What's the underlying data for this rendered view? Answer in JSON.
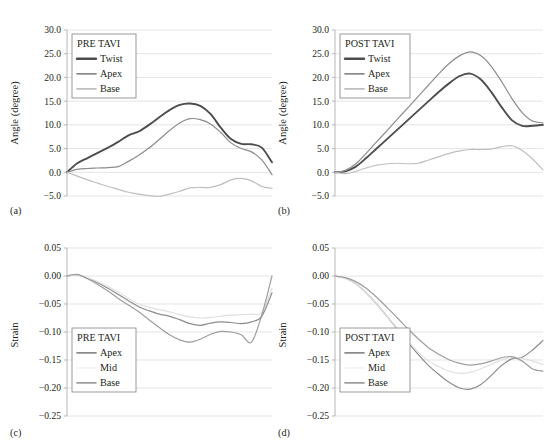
{
  "figure": {
    "panels": [
      {
        "key": "a",
        "caption": "(a)",
        "legend_title": "PRE TAVI",
        "ylabel": "Angle (degree)"
      },
      {
        "key": "b",
        "caption": "(b)",
        "legend_title": "POST TAVI",
        "ylabel": "Angle (degree)"
      },
      {
        "key": "c",
        "caption": "(c)",
        "legend_title": "PRE TAVI",
        "ylabel": "Strain"
      },
      {
        "key": "d",
        "caption": "(d)",
        "legend_title": "POST TAVI",
        "ylabel": "Strain"
      }
    ]
  },
  "colors": {
    "twist": "#4d4d4d",
    "apex": "#8c8c8c",
    "base": "#bfbfbf",
    "mid": "#e0e0e0",
    "grid": "#d9d9d9",
    "axis": "#a6a6a6",
    "text": "#231f20"
  },
  "chart_data": [
    {
      "id": "panel-a",
      "type": "line",
      "title": "PRE TAVI",
      "xlabel": "",
      "ylabel": "Angle (degree)",
      "ylim": [
        -5.0,
        30.0
      ],
      "ytick_labels": [
        "30.0",
        "25.0",
        "20.0",
        "15.0",
        "10.0",
        "5.0",
        "0.0",
        "-5.0"
      ],
      "yticks": [
        30.0,
        25.0,
        20.0,
        15.0,
        10.0,
        5.0,
        0.0,
        -5.0
      ],
      "xlim": [
        0,
        100
      ],
      "grid": true,
      "legend_position": "top-left",
      "x": [
        0,
        5,
        10,
        15,
        20,
        25,
        30,
        35,
        40,
        45,
        50,
        55,
        60,
        65,
        70,
        75,
        80,
        85,
        90,
        95,
        100
      ],
      "series": [
        {
          "name": "Twist",
          "color": "#4d4d4d",
          "width": 1.9,
          "values": [
            0.0,
            1.9,
            3.0,
            4.1,
            5.2,
            6.4,
            7.8,
            8.6,
            10.0,
            11.6,
            13.1,
            14.2,
            14.5,
            14.0,
            12.3,
            9.4,
            7.0,
            6.0,
            5.9,
            5.2,
            2.1
          ]
        },
        {
          "name": "Apex",
          "color": "#8c8c8c",
          "width": 1.2,
          "values": [
            0.0,
            0.6,
            0.8,
            0.9,
            1.0,
            1.2,
            2.3,
            3.6,
            5.1,
            6.9,
            8.8,
            10.4,
            11.3,
            11.1,
            10.2,
            8.4,
            6.2,
            5.0,
            4.3,
            2.6,
            -0.5
          ]
        },
        {
          "name": "Base",
          "color": "#bfbfbf",
          "width": 1.2,
          "values": [
            0.0,
            -0.8,
            -1.6,
            -2.3,
            -3.0,
            -3.6,
            -4.2,
            -4.6,
            -4.9,
            -5.1,
            -4.6,
            -4.0,
            -3.3,
            -3.2,
            -3.2,
            -2.6,
            -1.6,
            -1.3,
            -1.8,
            -3.0,
            -3.4
          ]
        }
      ]
    },
    {
      "id": "panel-b",
      "type": "line",
      "title": "POST TAVI",
      "xlabel": "",
      "ylabel": "Angle (degree)",
      "ylim": [
        -5.0,
        30.0
      ],
      "ytick_labels": [
        "30.0",
        "25.0",
        "20.0",
        "15.0",
        "10.0",
        "5.0",
        "0.0",
        "-5.0"
      ],
      "yticks": [
        30.0,
        25.0,
        20.0,
        15.0,
        10.0,
        5.0,
        0.0,
        -5.0
      ],
      "xlim": [
        0,
        100
      ],
      "grid": true,
      "legend_position": "top-left",
      "x": [
        0,
        5,
        10,
        15,
        20,
        25,
        30,
        35,
        40,
        45,
        50,
        55,
        60,
        65,
        70,
        75,
        80,
        85,
        90,
        95,
        100
      ],
      "series": [
        {
          "name": "Twist",
          "color": "#4d4d4d",
          "width": 1.9,
          "values": [
            0.0,
            0.2,
            1.2,
            3.0,
            5.0,
            7.0,
            9.0,
            11.0,
            13.0,
            15.0,
            17.0,
            18.8,
            20.3,
            20.8,
            19.6,
            17.0,
            13.8,
            11.0,
            9.8,
            9.8,
            10.0
          ]
        },
        {
          "name": "Apex",
          "color": "#8c8c8c",
          "width": 1.2,
          "values": [
            0.0,
            0.4,
            1.8,
            4.0,
            6.4,
            8.8,
            11.2,
            13.6,
            16.0,
            18.4,
            20.8,
            23.0,
            24.6,
            25.4,
            24.6,
            22.4,
            19.2,
            15.6,
            12.6,
            10.8,
            10.4
          ]
        },
        {
          "name": "Base",
          "color": "#bfbfbf",
          "width": 1.2,
          "values": [
            0.0,
            -0.3,
            0.2,
            0.9,
            1.5,
            1.8,
            1.9,
            1.8,
            1.9,
            2.6,
            3.3,
            4.0,
            4.5,
            4.8,
            4.8,
            4.9,
            5.4,
            5.6,
            4.6,
            2.8,
            0.5
          ]
        }
      ]
    },
    {
      "id": "panel-c",
      "type": "line",
      "title": "PRE TAVI",
      "xlabel": "",
      "ylabel": "Strain",
      "ylim": [
        -0.25,
        0.05
      ],
      "ytick_labels": [
        "0.05",
        "0.00",
        "-0.05",
        "-0.10",
        "-0.15",
        "-0.20",
        "-0.25"
      ],
      "yticks": [
        0.05,
        0.0,
        -0.05,
        -0.1,
        -0.15,
        -0.2,
        -0.25
      ],
      "xlim": [
        0,
        100
      ],
      "grid": true,
      "legend_position": "bottom-left",
      "x": [
        0,
        5,
        10,
        15,
        20,
        25,
        30,
        35,
        40,
        45,
        50,
        55,
        60,
        65,
        70,
        75,
        80,
        85,
        90,
        95,
        100
      ],
      "series": [
        {
          "name": "Apex",
          "color": "#8c8c8c",
          "width": 1.2,
          "values": [
            0.0,
            0.002,
            -0.004,
            -0.012,
            -0.022,
            -0.033,
            -0.044,
            -0.055,
            -0.062,
            -0.068,
            -0.072,
            -0.078,
            -0.085,
            -0.088,
            -0.084,
            -0.082,
            -0.083,
            -0.085,
            -0.082,
            -0.072,
            -0.03
          ]
        },
        {
          "name": "Mid",
          "color": "#e0e0e0",
          "width": 1.2,
          "values": [
            0.0,
            0.002,
            -0.003,
            -0.01,
            -0.019,
            -0.029,
            -0.04,
            -0.05,
            -0.056,
            -0.06,
            -0.064,
            -0.069,
            -0.073,
            -0.075,
            -0.074,
            -0.072,
            -0.07,
            -0.069,
            -0.068,
            -0.065,
            -0.022
          ]
        },
        {
          "name": "Base",
          "color": "#9e9e9e",
          "width": 1.2,
          "values": [
            0.0,
            0.003,
            -0.005,
            -0.015,
            -0.027,
            -0.04,
            -0.052,
            -0.064,
            -0.078,
            -0.092,
            -0.105,
            -0.114,
            -0.118,
            -0.113,
            -0.104,
            -0.099,
            -0.1,
            -0.105,
            -0.118,
            -0.07,
            0.0
          ]
        }
      ]
    },
    {
      "id": "panel-d",
      "type": "line",
      "title": "POST TAVI",
      "xlabel": "",
      "ylabel": "Strain",
      "ylim": [
        -0.25,
        0.05
      ],
      "ytick_labels": [
        "0.05",
        "0.00",
        "-0.05",
        "-0.10",
        "-0.15",
        "-0.20",
        "-0.25"
      ],
      "yticks": [
        0.05,
        0.0,
        -0.05,
        -0.1,
        -0.15,
        -0.2,
        -0.25
      ],
      "xlim": [
        0,
        100
      ],
      "grid": true,
      "legend_position": "bottom-left",
      "x": [
        0,
        5,
        10,
        15,
        20,
        25,
        30,
        35,
        40,
        45,
        50,
        55,
        60,
        65,
        70,
        75,
        80,
        85,
        90,
        95,
        100
      ],
      "series": [
        {
          "name": "Apex",
          "color": "#8c8c8c",
          "width": 1.2,
          "values": [
            0.0,
            -0.004,
            -0.014,
            -0.03,
            -0.05,
            -0.072,
            -0.095,
            -0.118,
            -0.14,
            -0.16,
            -0.176,
            -0.19,
            -0.2,
            -0.202,
            -0.194,
            -0.178,
            -0.16,
            -0.148,
            -0.145,
            -0.132,
            -0.115
          ]
        },
        {
          "name": "Mid",
          "color": "#e0e0e0",
          "width": 1.2,
          "values": [
            0.0,
            -0.004,
            -0.014,
            -0.03,
            -0.05,
            -0.072,
            -0.094,
            -0.116,
            -0.136,
            -0.152,
            -0.162,
            -0.17,
            -0.174,
            -0.172,
            -0.166,
            -0.158,
            -0.15,
            -0.146,
            -0.147,
            -0.152,
            -0.158
          ]
        },
        {
          "name": "Base",
          "color": "#9e9e9e",
          "width": 1.2,
          "values": [
            0.0,
            -0.003,
            -0.01,
            -0.022,
            -0.038,
            -0.056,
            -0.075,
            -0.094,
            -0.112,
            -0.128,
            -0.14,
            -0.15,
            -0.156,
            -0.159,
            -0.157,
            -0.152,
            -0.146,
            -0.144,
            -0.152,
            -0.166,
            -0.17
          ]
        }
      ]
    }
  ]
}
